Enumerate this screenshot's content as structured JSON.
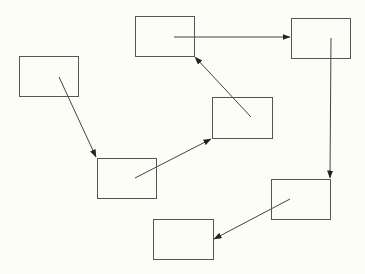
{
  "diagram": {
    "background": "#fdfdf8",
    "stroke_color": "#444444",
    "nodes": [
      {
        "id": "A",
        "label": "",
        "x": 19,
        "y": 56,
        "w": 60,
        "h": 41
      },
      {
        "id": "B",
        "label": "",
        "x": 135,
        "y": 16,
        "w": 60,
        "h": 41
      },
      {
        "id": "C",
        "label": "",
        "x": 291,
        "y": 18,
        "w": 60,
        "h": 41
      },
      {
        "id": "D",
        "label": "",
        "x": 212,
        "y": 97,
        "w": 61,
        "h": 42
      },
      {
        "id": "E",
        "label": "",
        "x": 97,
        "y": 158,
        "w": 60,
        "h": 41
      },
      {
        "id": "F",
        "label": "",
        "x": 271,
        "y": 179,
        "w": 60,
        "h": 41
      },
      {
        "id": "G",
        "label": "",
        "x": 153,
        "y": 219,
        "w": 61,
        "h": 41
      }
    ],
    "edges": [
      {
        "from": "A",
        "to": "E",
        "x1": 59,
        "y1": 77,
        "x2": 96,
        "y2": 157
      },
      {
        "from": "E",
        "to": "D",
        "x1": 135,
        "y1": 178,
        "x2": 211,
        "y2": 139
      },
      {
        "from": "D",
        "to": "B",
        "x1": 251,
        "y1": 117,
        "x2": 195,
        "y2": 57
      },
      {
        "from": "B",
        "to": "C",
        "x1": 174,
        "y1": 37,
        "x2": 290,
        "y2": 37
      },
      {
        "from": "C",
        "to": "F",
        "x1": 331,
        "y1": 38,
        "x2": 330,
        "y2": 178
      },
      {
        "from": "F",
        "to": "G",
        "x1": 290,
        "y1": 199,
        "x2": 214,
        "y2": 239
      }
    ]
  }
}
